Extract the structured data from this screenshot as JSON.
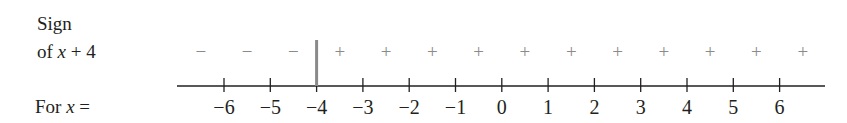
{
  "labels": {
    "sign_line1": "Sign",
    "sign_line2_prefix": "of ",
    "sign_line2_var": "x",
    "sign_line2_suffix": " + 4",
    "for_prefix": "For ",
    "for_var": "x",
    "for_suffix": " ="
  },
  "number_line": {
    "ticks": [
      -6,
      -5,
      -4,
      -3,
      -2,
      -1,
      0,
      1,
      2,
      3,
      4,
      5,
      6
    ],
    "tick_labels": [
      "−6",
      "−5",
      "−4",
      "−3",
      "−2",
      "−1",
      "0",
      "1",
      "2",
      "3",
      "4",
      "5",
      "6"
    ],
    "critical_point": -4,
    "signs": [
      "−",
      "−",
      "−",
      "+",
      "+",
      "+",
      "+",
      "+",
      "+",
      "+",
      "+",
      "+",
      "+",
      "+"
    ],
    "colors": {
      "axis": "#231f20",
      "signs": "#8a8a8a",
      "divider": "#8a8a8a"
    }
  }
}
